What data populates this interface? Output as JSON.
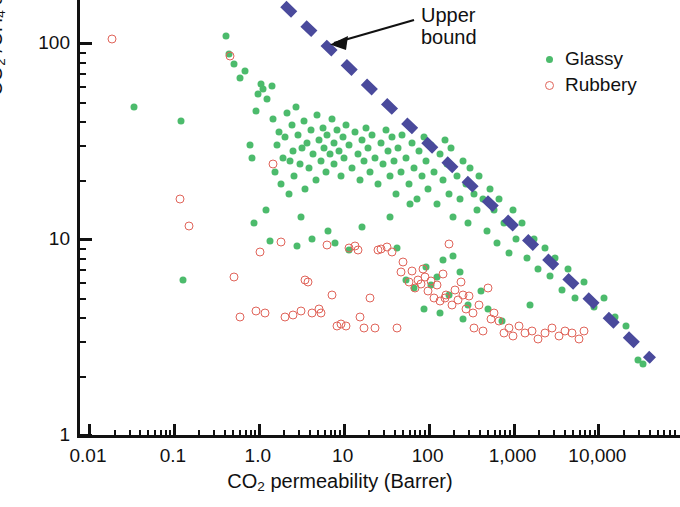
{
  "chart_data": {
    "type": "scatter",
    "title": "",
    "xlabel": "CO2 permeability (Barrer)",
    "ylabel": "CO2 /CH4 selectivity",
    "xscale": "log",
    "yscale": "log",
    "xlim": [
      0.01,
      50000
    ],
    "ylim": [
      1,
      200
    ],
    "grid": false,
    "legend_position": "top-right",
    "xticks": [
      "0.01",
      "0.1",
      "1.0",
      "10",
      "100",
      "1,000",
      "10,000"
    ],
    "xtick_values": [
      0.01,
      0.1,
      1.0,
      10,
      100,
      1000,
      10000
    ],
    "yticks": [
      "1",
      "10",
      "100"
    ],
    "ytick_values": [
      1,
      10,
      100
    ],
    "annotations": [
      {
        "text": "Upper bound",
        "line1": "Upper",
        "line2": "bound",
        "points_to": "dashed-upper-bound-line"
      }
    ],
    "series": [
      {
        "name": "Glassy",
        "marker": "filled-circle",
        "color": "#4cbb6c",
        "points": [
          [
            0.035,
            47
          ],
          [
            0.125,
            40
          ],
          [
            0.13,
            6.2
          ],
          [
            0.42,
            108
          ],
          [
            0.46,
            88
          ],
          [
            0.52,
            78
          ],
          [
            0.62,
            66
          ],
          [
            0.7,
            72
          ],
          [
            0.8,
            30
          ],
          [
            0.86,
            26
          ],
          [
            0.95,
            45
          ],
          [
            1.0,
            55
          ],
          [
            1.1,
            62
          ],
          [
            1.15,
            58
          ],
          [
            1.3,
            52
          ],
          [
            1.45,
            60
          ],
          [
            1.5,
            41
          ],
          [
            1.6,
            22
          ],
          [
            1.7,
            30
          ],
          [
            1.8,
            35
          ],
          [
            1.9,
            19
          ],
          [
            2.0,
            26
          ],
          [
            2.1,
            33
          ],
          [
            2.2,
            44
          ],
          [
            2.3,
            17
          ],
          [
            2.4,
            25
          ],
          [
            2.5,
            38
          ],
          [
            2.6,
            28
          ],
          [
            2.7,
            21
          ],
          [
            2.8,
            47
          ],
          [
            3.0,
            34
          ],
          [
            3.1,
            24
          ],
          [
            3.3,
            29
          ],
          [
            3.5,
            40
          ],
          [
            3.6,
            18
          ],
          [
            3.8,
            31
          ],
          [
            4.0,
            23
          ],
          [
            4.2,
            36
          ],
          [
            4.5,
            27
          ],
          [
            4.8,
            20
          ],
          [
            5.0,
            43
          ],
          [
            5.2,
            32
          ],
          [
            5.5,
            25
          ],
          [
            5.8,
            37
          ],
          [
            6.0,
            29
          ],
          [
            6.3,
            22
          ],
          [
            6.6,
            34
          ],
          [
            7.0,
            27
          ],
          [
            7.4,
            41
          ],
          [
            7.8,
            31
          ],
          [
            8.0,
            24
          ],
          [
            8.5,
            36
          ],
          [
            9.0,
            28
          ],
          [
            9.5,
            21
          ],
          [
            10,
            33
          ],
          [
            10.5,
            26
          ],
          [
            11,
            38
          ],
          [
            12,
            30
          ],
          [
            13,
            23
          ],
          [
            14,
            35
          ],
          [
            15,
            27
          ],
          [
            16,
            20
          ],
          [
            17,
            32
          ],
          [
            18,
            25
          ],
          [
            19,
            37
          ],
          [
            20,
            29
          ],
          [
            21,
            22
          ],
          [
            22,
            34
          ],
          [
            24,
            26
          ],
          [
            26,
            19
          ],
          [
            28,
            31
          ],
          [
            30,
            24
          ],
          [
            32,
            36
          ],
          [
            34,
            28
          ],
          [
            36,
            21
          ],
          [
            38,
            33
          ],
          [
            40,
            25
          ],
          [
            42,
            17
          ],
          [
            45,
            29
          ],
          [
            48,
            22
          ],
          [
            50,
            34
          ],
          [
            55,
            26
          ],
          [
            60,
            19
          ],
          [
            65,
            31
          ],
          [
            70,
            23
          ],
          [
            75,
            16
          ],
          [
            80,
            28
          ],
          [
            85,
            21
          ],
          [
            90,
            33
          ],
          [
            95,
            25
          ],
          [
            100,
            18
          ],
          [
            110,
            30
          ],
          [
            120,
            22
          ],
          [
            130,
            15
          ],
          [
            140,
            27
          ],
          [
            150,
            20
          ],
          [
            160,
            32
          ],
          [
            170,
            24
          ],
          [
            180,
            17
          ],
          [
            190,
            29
          ],
          [
            200,
            13
          ],
          [
            220,
            21
          ],
          [
            240,
            16
          ],
          [
            260,
            25
          ],
          [
            280,
            19
          ],
          [
            300,
            12
          ],
          [
            320,
            23
          ],
          [
            350,
            17
          ],
          [
            380,
            14
          ],
          [
            400,
            21
          ],
          [
            450,
            16
          ],
          [
            500,
            11
          ],
          [
            550,
            18
          ],
          [
            600,
            14
          ],
          [
            650,
            9.5
          ],
          [
            700,
            16
          ],
          [
            800,
            12
          ],
          [
            900,
            8.5
          ],
          [
            1000,
            14
          ],
          [
            1100,
            10
          ],
          [
            1300,
            12
          ],
          [
            1500,
            8
          ],
          [
            1800,
            10
          ],
          [
            2000,
            7
          ],
          [
            2400,
            9
          ],
          [
            2800,
            6.5
          ],
          [
            3200,
            8
          ],
          [
            3800,
            5.5
          ],
          [
            4500,
            7
          ],
          [
            5500,
            5
          ],
          [
            7000,
            6
          ],
          [
            9000,
            4.5
          ],
          [
            12000,
            5
          ],
          [
            16000,
            4
          ],
          [
            22000,
            3.6
          ],
          [
            30000,
            2.4
          ],
          [
            34000,
            2.3
          ],
          [
            0.9,
            12
          ],
          [
            1.4,
            9.8
          ],
          [
            2.9,
            9.2
          ],
          [
            4.4,
            10
          ],
          [
            8.2,
            9.5
          ],
          [
            12,
            8.8
          ],
          [
            55,
            6.2
          ],
          [
            70,
            5.6
          ],
          [
            95,
            7.2
          ],
          [
            130,
            6.4
          ],
          [
            180,
            5.2
          ],
          [
            240,
            6.8
          ],
          [
            300,
            4.6
          ],
          [
            420,
            5.4
          ],
          [
            1.25,
            14
          ],
          [
            3.2,
            13
          ],
          [
            6.8,
            11
          ],
          [
            17,
            11.5
          ],
          [
            44,
            9
          ],
          [
            140,
            4.2
          ],
          [
            260,
            3.9
          ],
          [
            520,
            4.4
          ],
          [
            760,
            3.8
          ],
          [
            1600,
            4.6
          ],
          [
            110,
            5.8
          ],
          [
            150,
            7.8
          ],
          [
            90,
            4.4
          ],
          [
            200,
            8.2
          ],
          [
            36,
            13
          ],
          [
            62,
            15
          ]
        ]
      },
      {
        "name": "Rubbery",
        "marker": "open-circle",
        "color": "#e0645a",
        "points": [
          [
            0.019,
            105
          ],
          [
            0.12,
            16
          ],
          [
            0.155,
            11.6
          ],
          [
            0.47,
            86
          ],
          [
            0.52,
            6.4
          ],
          [
            0.62,
            4.0
          ],
          [
            0.95,
            4.3
          ],
          [
            1.05,
            8.6
          ],
          [
            1.5,
            24
          ],
          [
            1.9,
            9.7
          ],
          [
            2.6,
            4.1
          ],
          [
            3.2,
            4.3
          ],
          [
            3.6,
            6.2
          ],
          [
            3.9,
            6.0
          ],
          [
            4.3,
            4.2
          ],
          [
            5.2,
            4.4
          ],
          [
            5.6,
            4.2
          ],
          [
            6.5,
            9.3
          ],
          [
            7.5,
            5.2
          ],
          [
            8.5,
            3.6
          ],
          [
            9.5,
            3.7
          ],
          [
            11,
            3.6
          ],
          [
            12,
            9.0
          ],
          [
            14,
            9.2
          ],
          [
            16,
            4.0
          ],
          [
            18,
            3.5
          ],
          [
            21,
            5.0
          ],
          [
            24,
            3.5
          ],
          [
            28,
            8.9
          ],
          [
            33,
            9.1
          ],
          [
            38,
            8.6
          ],
          [
            44,
            3.5
          ],
          [
            52,
            7.6
          ],
          [
            60,
            6.0
          ],
          [
            66,
            6.9
          ],
          [
            72,
            5.6
          ],
          [
            78,
            6.2
          ],
          [
            84,
            5.9
          ],
          [
            92,
            6.4
          ],
          [
            100,
            5.4
          ],
          [
            110,
            6.1
          ],
          [
            120,
            5.0
          ],
          [
            130,
            5.8
          ],
          [
            140,
            4.8
          ],
          [
            150,
            6.6
          ],
          [
            165,
            5.2
          ],
          [
            180,
            9.4
          ],
          [
            195,
            4.6
          ],
          [
            210,
            5.5
          ],
          [
            230,
            4.9
          ],
          [
            250,
            6.0
          ],
          [
            280,
            4.4
          ],
          [
            310,
            5.1
          ],
          [
            350,
            3.5
          ],
          [
            400,
            4.6
          ],
          [
            450,
            3.4
          ],
          [
            520,
            5.6
          ],
          [
            600,
            4.2
          ],
          [
            700,
            3.8
          ],
          [
            800,
            3.3
          ],
          [
            900,
            3.5
          ],
          [
            1000,
            3.2
          ],
          [
            1200,
            3.6
          ],
          [
            1400,
            3.3
          ],
          [
            1700,
            3.4
          ],
          [
            2000,
            3.1
          ],
          [
            2400,
            3.3
          ],
          [
            2900,
            3.5
          ],
          [
            3500,
            3.2
          ],
          [
            4200,
            3.4
          ],
          [
            5000,
            3.3
          ],
          [
            6000,
            3.1
          ],
          [
            7000,
            3.4
          ],
          [
            1.2,
            4.2
          ],
          [
            2.1,
            4.0
          ],
          [
            15,
            8.8
          ],
          [
            26,
            8.8
          ],
          [
            48,
            6.8
          ],
          [
            88,
            7.0
          ],
          [
            160,
            5.0
          ],
          [
            260,
            5.2
          ],
          [
            340,
            4.2
          ],
          [
            560,
            3.9
          ]
        ]
      }
    ],
    "upper_bound_line": {
      "label": "Upper bound",
      "style": "dashed",
      "color": "#4a4a9c",
      "from": [
        2.0,
        200
      ],
      "to": [
        45000,
        2.4
      ]
    }
  },
  "legend": {
    "items": [
      {
        "label": "Glassy",
        "marker": "filled-circle",
        "color": "#4cbb6c"
      },
      {
        "label": "Rubbery",
        "marker": "open-circle",
        "color": "#e0645a"
      }
    ]
  },
  "axes": {
    "x_title_prefix": "CO",
    "x_title_sub": "2",
    "x_title_suffix": " permeability (Barrer)",
    "y_title_p1": "CO",
    "y_title_s1": "2",
    "y_title_mid": " /CH",
    "y_title_s2": "4",
    "y_title_end": " selectivity"
  },
  "annotation": {
    "line1": "Upper",
    "line2": "bound"
  },
  "colors": {
    "glassy": "#4cbb6c",
    "rubbery": "#e0645a",
    "upper_bound": "#4a4a9c",
    "axis": "#111111"
  }
}
